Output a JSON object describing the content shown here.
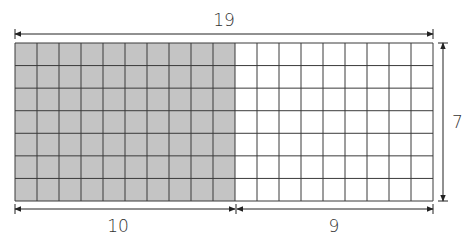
{
  "diagram": {
    "grid": {
      "columns": 19,
      "rows": 7,
      "shaded_columns": 10
    },
    "labels": {
      "top_width": "19",
      "right_height": "7",
      "bottom_left": "10",
      "bottom_right": "9"
    },
    "colors": {
      "shaded_fill": "#c4c4c4",
      "unshaded_fill": "#ffffff",
      "grid_line": "#3a3a3a",
      "arrow": "#222222"
    }
  }
}
